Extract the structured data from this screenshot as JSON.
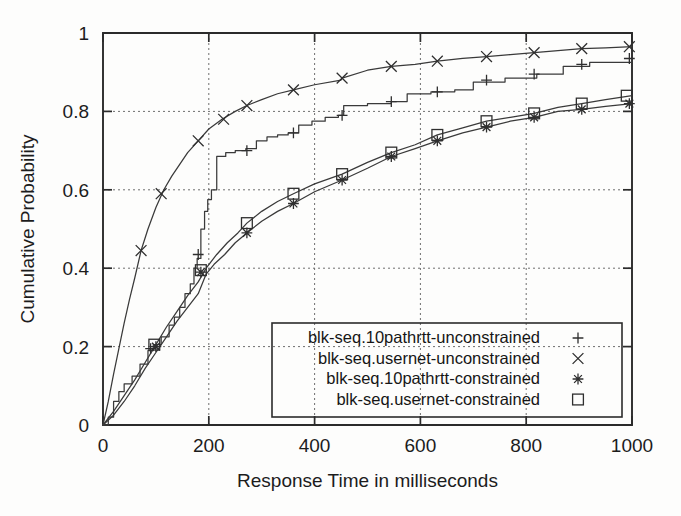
{
  "chart_data": {
    "type": "line",
    "title": "",
    "xlabel": "Response Time in milliseconds",
    "ylabel": "Cumulative Probability",
    "xlim": [
      0,
      1000
    ],
    "ylim": [
      0,
      1
    ],
    "xticks": [
      0,
      200,
      400,
      600,
      800,
      1000
    ],
    "xtick_labels": [
      "0",
      "200",
      "400",
      "600",
      "800",
      "1000"
    ],
    "yticks": [
      0,
      0.2,
      0.4,
      0.6,
      0.8,
      1
    ],
    "ytick_labels": [
      "0",
      "0.2",
      "0.4",
      "0.6",
      "0.8",
      "1"
    ],
    "grid": true,
    "legend_position": "lower-right-inside",
    "series": [
      {
        "name": "blk-seq.10pathrtt-unconstrained",
        "marker": "plus",
        "marker_glyph": "+",
        "style": "staircase",
        "points": [
          [
            0,
            0.0
          ],
          [
            10,
            0.02
          ],
          [
            20,
            0.06
          ],
          [
            30,
            0.085
          ],
          [
            40,
            0.105
          ],
          [
            55,
            0.125
          ],
          [
            70,
            0.155
          ],
          [
            85,
            0.19
          ],
          [
            95,
            0.205
          ],
          [
            110,
            0.225
          ],
          [
            125,
            0.255
          ],
          [
            135,
            0.275
          ],
          [
            145,
            0.3
          ],
          [
            155,
            0.335
          ],
          [
            165,
            0.36
          ],
          [
            172,
            0.4
          ],
          [
            178,
            0.425
          ],
          [
            185,
            0.5
          ],
          [
            192,
            0.545
          ],
          [
            198,
            0.575
          ],
          [
            205,
            0.6
          ],
          [
            215,
            0.685
          ],
          [
            232,
            0.695
          ],
          [
            250,
            0.7
          ],
          [
            270,
            0.705
          ],
          [
            290,
            0.725
          ],
          [
            310,
            0.735
          ],
          [
            330,
            0.74
          ],
          [
            350,
            0.745
          ],
          [
            370,
            0.765
          ],
          [
            395,
            0.775
          ],
          [
            420,
            0.785
          ],
          [
            445,
            0.79
          ],
          [
            455,
            0.815
          ],
          [
            500,
            0.82
          ],
          [
            545,
            0.825
          ],
          [
            575,
            0.845
          ],
          [
            620,
            0.85
          ],
          [
            665,
            0.855
          ],
          [
            700,
            0.875
          ],
          [
            760,
            0.885
          ],
          [
            820,
            0.895
          ],
          [
            870,
            0.915
          ],
          [
            920,
            0.925
          ],
          [
            1000,
            0.935
          ]
        ],
        "marker_points": [
          [
            90,
            0.195
          ],
          [
            180,
            0.435
          ],
          [
            272,
            0.7
          ],
          [
            360,
            0.745
          ],
          [
            452,
            0.79
          ],
          [
            545,
            0.825
          ],
          [
            632,
            0.85
          ],
          [
            725,
            0.88
          ],
          [
            815,
            0.895
          ],
          [
            905,
            0.92
          ],
          [
            995,
            0.935
          ]
        ]
      },
      {
        "name": "blk-seq.usernet-unconstrained",
        "marker": "cross",
        "marker_glyph": "×",
        "style": "smooth",
        "points": [
          [
            0,
            0.0
          ],
          [
            10,
            0.06
          ],
          [
            20,
            0.13
          ],
          [
            30,
            0.195
          ],
          [
            40,
            0.26
          ],
          [
            50,
            0.32
          ],
          [
            60,
            0.375
          ],
          [
            72,
            0.445
          ],
          [
            85,
            0.5
          ],
          [
            100,
            0.555
          ],
          [
            115,
            0.6
          ],
          [
            130,
            0.635
          ],
          [
            145,
            0.665
          ],
          [
            160,
            0.695
          ],
          [
            180,
            0.725
          ],
          [
            200,
            0.755
          ],
          [
            225,
            0.78
          ],
          [
            250,
            0.8
          ],
          [
            272,
            0.815
          ],
          [
            300,
            0.83
          ],
          [
            330,
            0.845
          ],
          [
            360,
            0.855
          ],
          [
            400,
            0.868
          ],
          [
            450,
            0.88
          ],
          [
            452,
            0.885
          ],
          [
            500,
            0.905
          ],
          [
            545,
            0.915
          ],
          [
            590,
            0.92
          ],
          [
            632,
            0.928
          ],
          [
            680,
            0.935
          ],
          [
            725,
            0.94
          ],
          [
            770,
            0.945
          ],
          [
            815,
            0.95
          ],
          [
            860,
            0.955
          ],
          [
            905,
            0.96
          ],
          [
            950,
            0.962
          ],
          [
            1000,
            0.965
          ]
        ],
        "marker_points": [
          [
            72,
            0.445
          ],
          [
            110,
            0.59
          ],
          [
            180,
            0.725
          ],
          [
            228,
            0.78
          ],
          [
            272,
            0.815
          ],
          [
            360,
            0.855
          ],
          [
            452,
            0.885
          ],
          [
            545,
            0.915
          ],
          [
            632,
            0.928
          ],
          [
            725,
            0.94
          ],
          [
            815,
            0.95
          ],
          [
            905,
            0.96
          ],
          [
            995,
            0.965
          ]
        ]
      },
      {
        "name": "blk-seq.10pathrtt-constrained",
        "marker": "star",
        "marker_glyph": "✳",
        "style": "smooth",
        "points": [
          [
            0,
            0.0
          ],
          [
            20,
            0.025
          ],
          [
            40,
            0.06
          ],
          [
            60,
            0.1
          ],
          [
            80,
            0.145
          ],
          [
            100,
            0.185
          ],
          [
            120,
            0.225
          ],
          [
            140,
            0.265
          ],
          [
            160,
            0.3
          ],
          [
            180,
            0.335
          ],
          [
            195,
            0.385
          ],
          [
            210,
            0.41
          ],
          [
            230,
            0.435
          ],
          [
            250,
            0.465
          ],
          [
            272,
            0.49
          ],
          [
            300,
            0.52
          ],
          [
            330,
            0.545
          ],
          [
            360,
            0.565
          ],
          [
            400,
            0.595
          ],
          [
            452,
            0.625
          ],
          [
            500,
            0.655
          ],
          [
            545,
            0.685
          ],
          [
            590,
            0.705
          ],
          [
            632,
            0.725
          ],
          [
            680,
            0.745
          ],
          [
            725,
            0.76
          ],
          [
            770,
            0.775
          ],
          [
            815,
            0.785
          ],
          [
            860,
            0.8
          ],
          [
            905,
            0.805
          ],
          [
            950,
            0.813
          ],
          [
            1000,
            0.82
          ]
        ],
        "marker_points": [
          [
            100,
            0.2
          ],
          [
            185,
            0.39
          ],
          [
            272,
            0.49
          ],
          [
            360,
            0.565
          ],
          [
            452,
            0.625
          ],
          [
            545,
            0.685
          ],
          [
            632,
            0.725
          ],
          [
            725,
            0.76
          ],
          [
            815,
            0.785
          ],
          [
            905,
            0.805
          ],
          [
            995,
            0.82
          ]
        ]
      },
      {
        "name": "blk-seq.usernet-constrained",
        "marker": "square",
        "marker_glyph": "□",
        "style": "smooth",
        "points": [
          [
            0,
            0.0
          ],
          [
            20,
            0.035
          ],
          [
            40,
            0.075
          ],
          [
            60,
            0.115
          ],
          [
            80,
            0.16
          ],
          [
            100,
            0.205
          ],
          [
            120,
            0.25
          ],
          [
            140,
            0.29
          ],
          [
            160,
            0.33
          ],
          [
            180,
            0.365
          ],
          [
            195,
            0.4
          ],
          [
            215,
            0.435
          ],
          [
            235,
            0.465
          ],
          [
            255,
            0.49
          ],
          [
            272,
            0.515
          ],
          [
            300,
            0.545
          ],
          [
            330,
            0.57
          ],
          [
            360,
            0.59
          ],
          [
            400,
            0.615
          ],
          [
            452,
            0.64
          ],
          [
            500,
            0.67
          ],
          [
            545,
            0.695
          ],
          [
            590,
            0.715
          ],
          [
            632,
            0.74
          ],
          [
            680,
            0.758
          ],
          [
            725,
            0.775
          ],
          [
            770,
            0.785
          ],
          [
            815,
            0.795
          ],
          [
            860,
            0.81
          ],
          [
            905,
            0.82
          ],
          [
            950,
            0.83
          ],
          [
            1000,
            0.84
          ]
        ],
        "marker_points": [
          [
            97,
            0.205
          ],
          [
            185,
            0.395
          ],
          [
            272,
            0.515
          ],
          [
            360,
            0.59
          ],
          [
            452,
            0.64
          ],
          [
            545,
            0.695
          ],
          [
            632,
            0.74
          ],
          [
            725,
            0.775
          ],
          [
            815,
            0.795
          ],
          [
            905,
            0.82
          ],
          [
            990,
            0.84
          ]
        ]
      }
    ],
    "legend_entries": [
      {
        "label": "blk-seq.10pathrtt-unconstrained",
        "marker": "plus"
      },
      {
        "label": "blk-seq.usernet-unconstrained",
        "marker": "cross"
      },
      {
        "label": "blk-seq.10pathrtt-constrained",
        "marker": "star"
      },
      {
        "label": "blk-seq.usernet-constrained",
        "marker": "square"
      }
    ],
    "colors": {
      "line": "#3a3a3a",
      "axis": "#2b2b2b",
      "grid": "#6e6e6e",
      "text": "#1c1c1c",
      "background": "#fdfdfc"
    }
  }
}
